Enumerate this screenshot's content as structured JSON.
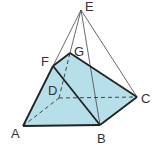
{
  "diagram": {
    "type": "geometric-solid",
    "fill_color": "#b7dfea",
    "edge_color": "#222222",
    "thin_edge_color": "#444444",
    "vertices": {
      "A": {
        "label": "A",
        "x": 23,
        "y": 126,
        "lx": 11,
        "ly": 138
      },
      "B": {
        "label": "B",
        "x": 100,
        "y": 125,
        "lx": 97,
        "ly": 143
      },
      "C": {
        "label": "C",
        "x": 137,
        "y": 97,
        "lx": 141,
        "ly": 103
      },
      "D": {
        "label": "D",
        "x": 59,
        "y": 98,
        "lx": 48,
        "ly": 95
      },
      "E": {
        "label": "E",
        "x": 81,
        "y": 10,
        "lx": 85,
        "ly": 11
      },
      "F": {
        "label": "F",
        "x": 53,
        "y": 66,
        "lx": 41,
        "ly": 66
      },
      "G": {
        "label": "G",
        "x": 70,
        "y": 53,
        "lx": 74,
        "ly": 56
      }
    },
    "labels": {
      "A": "A",
      "B": "B",
      "C": "C",
      "D": "D",
      "E": "E",
      "F": "F",
      "G": "G"
    }
  }
}
